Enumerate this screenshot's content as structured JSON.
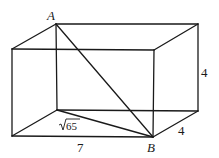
{
  "diagram": {
    "type": "rectangular-prism",
    "vertices": {
      "A": [
        56,
        24
      ],
      "back_top_right": [
        198,
        24
      ],
      "front_top_left": [
        12,
        49
      ],
      "front_top_right": [
        154,
        50
      ],
      "back_bottom_left": [
        57,
        110
      ],
      "back_bottom_right": [
        198,
        111
      ],
      "front_bottom_left": [
        12,
        136
      ],
      "B": [
        153,
        137
      ]
    },
    "labels": {
      "point_a": "A",
      "point_b": "B",
      "length": "7",
      "width": "4",
      "height": "4",
      "base_diagonal_radicand": "65",
      "base_diagonal_symbol": "√"
    }
  }
}
